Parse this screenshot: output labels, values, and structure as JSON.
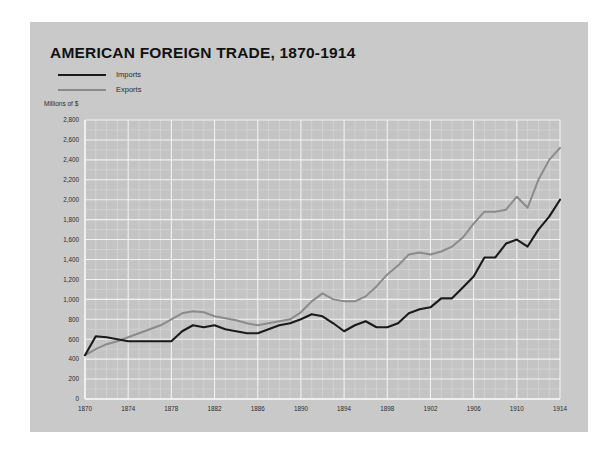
{
  "card": {
    "background": "#c9c9c9"
  },
  "chart_data": {
    "type": "line",
    "title": "AMERICAN FOREIGN TRADE, 1870-1914",
    "subtitle": "",
    "units_label": "Millions of $",
    "xlabel": "",
    "ylabel": "Millions of $",
    "xlim": [
      1870,
      1914
    ],
    "ylim": [
      0,
      2800
    ],
    "ytick_step": 200,
    "xtick_step": 4,
    "grid": true,
    "grid_minor": "every year and every 200 units",
    "legend_position": "top-left",
    "yticks": [
      "0",
      "200",
      "400",
      "600",
      "800",
      "1,000",
      "1,200",
      "1,400",
      "1,600",
      "1,800",
      "2,000",
      "2,200",
      "2,400",
      "2,600",
      "2,800"
    ],
    "ytick_values": [
      0,
      200,
      400,
      600,
      800,
      1000,
      1200,
      1400,
      1600,
      1800,
      2000,
      2200,
      2400,
      2600,
      2800
    ],
    "xticks": [
      "1870",
      "1874",
      "1878",
      "1882",
      "1886",
      "1890",
      "1894",
      "1898",
      "1902",
      "1906",
      "1910",
      "1914"
    ],
    "xtick_values": [
      1870,
      1874,
      1878,
      1882,
      1886,
      1890,
      1894,
      1898,
      1902,
      1906,
      1910,
      1914
    ],
    "x": [
      1870,
      1871,
      1872,
      1873,
      1874,
      1875,
      1876,
      1877,
      1878,
      1879,
      1880,
      1881,
      1882,
      1883,
      1884,
      1885,
      1886,
      1887,
      1888,
      1889,
      1890,
      1891,
      1892,
      1893,
      1894,
      1895,
      1896,
      1897,
      1898,
      1899,
      1900,
      1901,
      1902,
      1903,
      1904,
      1905,
      1906,
      1907,
      1908,
      1909,
      1910,
      1911,
      1912,
      1913,
      1914
    ],
    "series": [
      {
        "name": "Imports",
        "color": "#1a1a1a",
        "values": [
          440,
          630,
          620,
          600,
          580,
          580,
          580,
          580,
          580,
          680,
          740,
          720,
          740,
          700,
          680,
          660,
          660,
          700,
          740,
          760,
          800,
          850,
          830,
          760,
          680,
          740,
          780,
          720,
          720,
          760,
          860,
          900,
          920,
          1010,
          1010,
          1120,
          1230,
          1420,
          1420,
          1560,
          1600,
          1530,
          1700,
          1830,
          2000
        ]
      },
      {
        "name": "Exports",
        "color": "#8b8b8b",
        "values": [
          440,
          500,
          550,
          580,
          620,
          660,
          700,
          740,
          800,
          860,
          880,
          870,
          830,
          810,
          790,
          760,
          740,
          760,
          780,
          800,
          870,
          980,
          1060,
          1000,
          980,
          980,
          1030,
          1130,
          1250,
          1340,
          1450,
          1470,
          1450,
          1480,
          1530,
          1620,
          1760,
          1880,
          1880,
          1900,
          2030,
          1920,
          2200,
          2400,
          2520
        ]
      }
    ]
  },
  "legend": {
    "items": [
      {
        "label": "Imports",
        "color": "#1a1a1a"
      },
      {
        "label": "Exports",
        "color": "#8b8b8b"
      }
    ]
  }
}
